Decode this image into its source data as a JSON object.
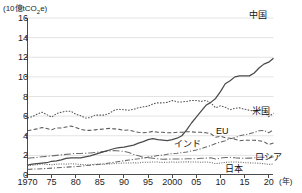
{
  "axis": {
    "unit_label_prefix": "(10億tCO",
    "unit_label_sub": "2",
    "unit_label_suffix": "e)",
    "x_unit": "(年)",
    "y_ticks": [
      "16",
      "14",
      "12",
      "10",
      "8",
      "6",
      "4",
      "2",
      "0"
    ],
    "x_ticks": [
      "1970",
      "75",
      "80",
      "85",
      "90",
      "95",
      "2000",
      "05",
      "10",
      "15",
      "20"
    ]
  },
  "labels": {
    "china": "中国",
    "usa": "米国",
    "eu": "EU",
    "india": "インド",
    "russia": "ロシア",
    "japan": "日本"
  },
  "chart_data": {
    "type": "line",
    "title": "",
    "xlabel": "(年)",
    "ylabel": "(10億tCO2e)",
    "xlim": [
      1970,
      2021
    ],
    "ylim": [
      0,
      16
    ],
    "grid": true,
    "legend_position": "inline-right",
    "x": [
      1970,
      1971,
      1972,
      1973,
      1974,
      1975,
      1976,
      1977,
      1978,
      1979,
      1980,
      1981,
      1982,
      1983,
      1984,
      1985,
      1986,
      1987,
      1988,
      1989,
      1990,
      1991,
      1992,
      1993,
      1994,
      1995,
      1996,
      1997,
      1998,
      1999,
      2000,
      2001,
      2002,
      2003,
      2004,
      2005,
      2006,
      2007,
      2008,
      2009,
      2010,
      2011,
      2012,
      2013,
      2014,
      2015,
      2016,
      2017,
      2018,
      2019,
      2020,
      2021
    ],
    "series": [
      {
        "name": "中国",
        "style": "solid",
        "color": "#4a4a4a",
        "values": [
          1.0,
          1.1,
          1.15,
          1.2,
          1.25,
          1.4,
          1.45,
          1.55,
          1.7,
          1.75,
          1.75,
          1.75,
          1.85,
          1.95,
          2.1,
          2.25,
          2.4,
          2.55,
          2.7,
          2.8,
          2.85,
          2.95,
          3.05,
          3.25,
          3.4,
          3.6,
          3.7,
          3.6,
          3.55,
          3.5,
          3.6,
          3.75,
          4.0,
          4.6,
          5.3,
          5.9,
          6.5,
          7.1,
          7.4,
          7.8,
          8.5,
          9.3,
          9.6,
          10.0,
          10.1,
          10.1,
          10.1,
          10.4,
          10.9,
          11.3,
          11.5,
          11.9
        ]
      },
      {
        "name": "米国",
        "style": "dotted",
        "color": "#555555",
        "values": [
          5.8,
          5.95,
          6.2,
          6.4,
          6.15,
          5.9,
          6.25,
          6.4,
          6.5,
          6.5,
          6.2,
          6.05,
          5.8,
          5.85,
          6.1,
          6.1,
          6.1,
          6.3,
          6.6,
          6.7,
          6.65,
          6.6,
          6.7,
          6.85,
          6.95,
          7.0,
          7.25,
          7.35,
          7.35,
          7.4,
          7.6,
          7.45,
          7.45,
          7.5,
          7.6,
          7.6,
          7.5,
          7.6,
          7.35,
          6.85,
          7.05,
          6.9,
          6.65,
          6.8,
          6.85,
          6.7,
          6.6,
          6.5,
          6.7,
          6.55,
          5.95,
          6.3
        ]
      },
      {
        "name": "EU",
        "style": "dashed",
        "color": "#5a5a5a",
        "values": [
          4.5,
          4.6,
          4.7,
          4.85,
          4.75,
          4.6,
          4.8,
          4.8,
          4.9,
          5.0,
          4.85,
          4.65,
          4.55,
          4.55,
          4.6,
          4.65,
          4.7,
          4.75,
          4.7,
          4.65,
          4.55,
          4.6,
          4.45,
          4.35,
          4.3,
          4.35,
          4.45,
          4.35,
          4.35,
          4.3,
          4.3,
          4.35,
          4.35,
          4.4,
          4.4,
          4.35,
          4.35,
          4.3,
          4.2,
          3.85,
          3.95,
          3.8,
          3.75,
          3.65,
          3.5,
          3.55,
          3.55,
          3.55,
          3.5,
          3.4,
          3.1,
          3.25
        ]
      },
      {
        "name": "インド",
        "style": "dashdot",
        "color": "#6a6a6a",
        "values": [
          0.55,
          0.6,
          0.62,
          0.64,
          0.66,
          0.7,
          0.73,
          0.77,
          0.8,
          0.83,
          0.85,
          0.9,
          0.95,
          1.0,
          1.05,
          1.1,
          1.15,
          1.22,
          1.3,
          1.38,
          1.45,
          1.52,
          1.6,
          1.65,
          1.72,
          1.82,
          1.9,
          1.98,
          2.02,
          2.12,
          2.18,
          2.22,
          2.28,
          2.35,
          2.45,
          2.55,
          2.68,
          2.85,
          3.0,
          3.2,
          3.35,
          3.5,
          3.7,
          3.8,
          4.0,
          4.1,
          4.2,
          4.35,
          4.5,
          4.55,
          4.3,
          4.6
        ]
      },
      {
        "name": "ロシア",
        "style": "dashdot-long",
        "color": "#6f6f6f",
        "values": [
          1.7,
          1.75,
          1.8,
          1.85,
          1.9,
          1.95,
          2.0,
          2.05,
          2.1,
          2.15,
          2.2,
          2.2,
          2.22,
          2.25,
          2.3,
          2.35,
          2.4,
          2.45,
          2.5,
          2.45,
          2.4,
          2.3,
          2.1,
          1.95,
          1.8,
          1.75,
          1.7,
          1.65,
          1.6,
          1.62,
          1.62,
          1.63,
          1.62,
          1.65,
          1.65,
          1.65,
          1.7,
          1.72,
          1.75,
          1.62,
          1.72,
          1.78,
          1.8,
          1.75,
          1.72,
          1.7,
          1.72,
          1.75,
          1.8,
          1.8,
          1.72,
          1.85
        ]
      },
      {
        "name": "日本",
        "style": "dotted-fine",
        "color": "#707070",
        "values": [
          0.95,
          1.0,
          1.05,
          1.12,
          1.08,
          1.05,
          1.1,
          1.12,
          1.1,
          1.15,
          1.12,
          1.08,
          1.05,
          1.05,
          1.1,
          1.1,
          1.1,
          1.12,
          1.18,
          1.2,
          1.22,
          1.22,
          1.24,
          1.23,
          1.3,
          1.3,
          1.32,
          1.32,
          1.28,
          1.3,
          1.32,
          1.29,
          1.33,
          1.34,
          1.33,
          1.32,
          1.3,
          1.33,
          1.27,
          1.16,
          1.22,
          1.28,
          1.32,
          1.33,
          1.3,
          1.26,
          1.24,
          1.22,
          1.2,
          1.15,
          1.08,
          1.12
        ]
      }
    ]
  }
}
